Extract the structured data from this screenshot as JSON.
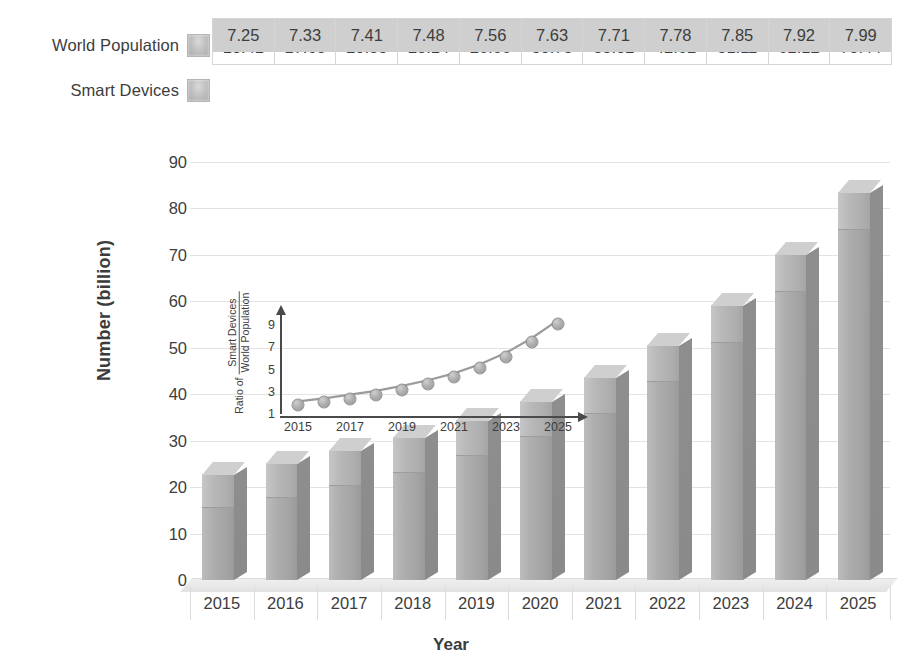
{
  "legend": {
    "series": [
      {
        "label": "World Population",
        "swatch": "gray-square-swatch"
      },
      {
        "label": "Smart Devices",
        "swatch": "gray-square-swatch"
      }
    ]
  },
  "table": {
    "row_world_population": [
      "7.25",
      "7.33",
      "7.41",
      "7.48",
      "7.56",
      "7.63",
      "7.71",
      "7.78",
      "7.85",
      "7.92",
      "7.99"
    ],
    "row_smart_devices": [
      "15.41",
      "17.68",
      "20.35",
      "23.14",
      "26.66",
      "30.73",
      "35.82",
      "42.62",
      "51.11",
      "62.12",
      "75.44"
    ]
  },
  "main_axes": {
    "ylabel": "Number (billion)",
    "xlabel": "Year",
    "yticks": [
      "90",
      "80",
      "70",
      "60",
      "50",
      "40",
      "30",
      "20",
      "10",
      "0"
    ],
    "xticks": [
      "2015",
      "2016",
      "2017",
      "2018",
      "2019",
      "2020",
      "2021",
      "2022",
      "2023",
      "2024",
      "2025"
    ]
  },
  "inset": {
    "ylabel_prefix": "Ratio of",
    "ylabel_numerator": "Smart Devices",
    "ylabel_denominator": "World Population",
    "yticks": [
      "9",
      "7",
      "5",
      "3",
      "1"
    ],
    "xticks": [
      "2015",
      "2017",
      "2019",
      "2021",
      "2023",
      "2025"
    ]
  },
  "colors": {
    "bar_front": "#adadad",
    "bar_side": "#8c8c8c",
    "bar_top": "#cfcfcf",
    "grid": "#e3e3e3",
    "text": "#3d3d3d",
    "table_separator": "#dedede"
  },
  "chart_data": [
    {
      "type": "bar",
      "title": "",
      "subtype": "stacked-3d-column",
      "categories": [
        "2015",
        "2016",
        "2017",
        "2018",
        "2019",
        "2020",
        "2021",
        "2022",
        "2023",
        "2024",
        "2025"
      ],
      "series": [
        {
          "name": "Smart Devices",
          "values": [
            15.41,
            17.68,
            20.35,
            23.14,
            26.66,
            30.73,
            35.82,
            42.62,
            51.11,
            62.12,
            75.44
          ]
        },
        {
          "name": "World Population",
          "values": [
            7.25,
            7.33,
            7.41,
            7.48,
            7.56,
            7.63,
            7.71,
            7.78,
            7.85,
            7.92,
            7.99
          ]
        }
      ],
      "totals": [
        22.66,
        25.01,
        27.76,
        30.62,
        34.22,
        38.36,
        43.53,
        50.4,
        58.96,
        70.04,
        83.43
      ],
      "xlabel": "Year",
      "ylabel": "Number (billion)",
      "ylim": [
        0,
        90
      ],
      "ytick_step": 10,
      "grid": true,
      "legend_position": "top"
    },
    {
      "type": "line",
      "title": "",
      "inset": true,
      "x": [
        2015,
        2016,
        2017,
        2018,
        2019,
        2020,
        2021,
        2022,
        2023,
        2024,
        2025
      ],
      "categories": [
        "2015",
        "2016",
        "2017",
        "2018",
        "2019",
        "2020",
        "2021",
        "2022",
        "2023",
        "2024",
        "2025"
      ],
      "series": [
        {
          "name": "Ratio of Smart Devices / World Population",
          "values": [
            2.13,
            2.41,
            2.75,
            3.09,
            3.53,
            4.03,
            4.65,
            5.48,
            6.51,
            7.84,
            9.44
          ]
        }
      ],
      "xlabel": "",
      "ylabel": "Ratio of Smart Devices / World Population",
      "ylim": [
        1,
        10
      ],
      "xtick_labels": [
        "2015",
        "2017",
        "2019",
        "2021",
        "2023",
        "2025"
      ],
      "ytick_labels": [
        "1",
        "3",
        "5",
        "7",
        "9"
      ],
      "markers": "circle",
      "grid": false,
      "legend_position": "none"
    }
  ]
}
